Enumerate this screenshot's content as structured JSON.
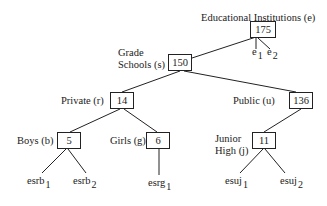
{
  "diagram": {
    "type": "tree",
    "root": {
      "id": "e",
      "label": "Educational Institutions (e)",
      "value": "175",
      "leaves": [
        {
          "base": "e",
          "sub": "1"
        },
        {
          "base": "e",
          "sub": "2"
        }
      ]
    },
    "nodes": {
      "s": {
        "label_line1": "Grade",
        "label_line2": "Schools (s)",
        "value": "150"
      },
      "r": {
        "label": "Private (r)",
        "value": "14"
      },
      "u": {
        "label": "Public (u)",
        "value": "136"
      },
      "b": {
        "label": "Boys (b)",
        "value": "5"
      },
      "g": {
        "label": "Girls (g)",
        "value": "6"
      },
      "j": {
        "label_line1": "Junior",
        "label_line2": "High (j)",
        "value": "11"
      }
    },
    "leaves": {
      "esrb1": {
        "base": "esrb",
        "sub": "1"
      },
      "esrb2": {
        "base": "esrb",
        "sub": "2"
      },
      "esrg1": {
        "base": "esrg",
        "sub": "1"
      },
      "esuj1": {
        "base": "esuj",
        "sub": "1"
      },
      "esuj2": {
        "base": "esuj",
        "sub": "2"
      }
    },
    "edges": [
      [
        "e",
        "s"
      ],
      [
        "e",
        "e1"
      ],
      [
        "e",
        "e2"
      ],
      [
        "s",
        "r"
      ],
      [
        "s",
        "u"
      ],
      [
        "r",
        "b"
      ],
      [
        "r",
        "g"
      ],
      [
        "u",
        "j"
      ],
      [
        "b",
        "esrb1"
      ],
      [
        "b",
        "esrb2"
      ],
      [
        "g",
        "esrg1"
      ],
      [
        "j",
        "esuj1"
      ],
      [
        "j",
        "esuj2"
      ]
    ],
    "line_color": "#222222"
  }
}
